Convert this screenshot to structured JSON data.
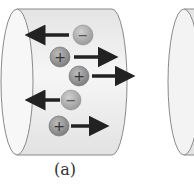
{
  "figure": {
    "panels": [
      {
        "id": "a",
        "caption": "(a)",
        "charges": [
          {
            "sign": "-",
            "symbol": "−",
            "cx": 83,
            "cy": 35,
            "direction": "left"
          },
          {
            "sign": "+",
            "symbol": "+",
            "cx": 60,
            "cy": 57,
            "direction": "right"
          },
          {
            "sign": "+",
            "symbol": "+",
            "cx": 79,
            "cy": 76,
            "direction": "right"
          },
          {
            "sign": "-",
            "symbol": "−",
            "cx": 71,
            "cy": 100,
            "direction": "left"
          },
          {
            "sign": "+",
            "symbol": "+",
            "cx": 59,
            "cy": 126,
            "direction": "right"
          }
        ]
      },
      {
        "id": "b",
        "caption": "",
        "partially_visible": true
      }
    ],
    "colors": {
      "cylinder_fill": "#ececec",
      "cylinder_edge": "#8a8a8a",
      "charge_fill_positive": "#8c8c8c",
      "charge_fill_negative": "#a9a9a9",
      "arrow": "#222222"
    }
  }
}
